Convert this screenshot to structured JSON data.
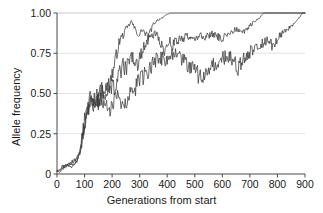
{
  "chart_data": {
    "type": "line",
    "title": "",
    "xlabel": "Generations from start",
    "ylabel": "Allele frequency",
    "xlim": [
      0,
      900
    ],
    "ylim": [
      0,
      1.0
    ],
    "xticks": [
      0,
      100,
      200,
      300,
      400,
      500,
      600,
      700,
      800,
      900
    ],
    "xtick_labels": [
      "0",
      "100",
      "200",
      "300",
      "400",
      "500",
      "600",
      "700",
      "800",
      "900"
    ],
    "yticks": [
      0,
      0.25,
      0.5,
      0.75,
      1.0
    ],
    "ytick_labels": [
      "0",
      "0.25",
      "0.50",
      "0.75",
      "1.00"
    ],
    "grid": "horizontal",
    "grid_color": "#d9d9d9",
    "line_color": "#3a3a3a",
    "legend": "none",
    "series": [
      {
        "name": "replicate-1",
        "comment": "fastest fixation; reaches 1.00 near generation 420 and stays fixed",
        "x": [
          0,
          10,
          20,
          30,
          40,
          50,
          60,
          70,
          80,
          90,
          100,
          110,
          120,
          130,
          140,
          150,
          160,
          170,
          180,
          190,
          200,
          210,
          220,
          230,
          240,
          250,
          260,
          270,
          280,
          290,
          300,
          310,
          320,
          330,
          340,
          350,
          360,
          370,
          380,
          390,
          400,
          410,
          420,
          500,
          600,
          700,
          800,
          900
        ],
        "y": [
          0.02,
          0.03,
          0.05,
          0.04,
          0.06,
          0.07,
          0.06,
          0.09,
          0.12,
          0.2,
          0.3,
          0.4,
          0.45,
          0.44,
          0.47,
          0.46,
          0.5,
          0.54,
          0.52,
          0.57,
          0.62,
          0.68,
          0.78,
          0.84,
          0.86,
          0.9,
          0.92,
          0.95,
          0.91,
          0.88,
          0.86,
          0.9,
          0.87,
          0.85,
          0.89,
          0.93,
          0.95,
          0.96,
          0.97,
          0.98,
          0.99,
          1.0,
          1.0,
          1.0,
          1.0,
          1.0,
          1.0,
          1.0
        ]
      },
      {
        "name": "replicate-2",
        "comment": "intermediate; wanders near 0.80-0.90 then fixes near generation 750",
        "x": [
          0,
          10,
          20,
          30,
          40,
          50,
          60,
          70,
          80,
          90,
          100,
          110,
          120,
          130,
          140,
          150,
          160,
          170,
          180,
          190,
          200,
          210,
          220,
          230,
          240,
          250,
          260,
          270,
          280,
          290,
          300,
          310,
          320,
          330,
          340,
          350,
          360,
          370,
          380,
          390,
          400,
          410,
          420,
          430,
          440,
          450,
          460,
          470,
          480,
          490,
          500,
          520,
          540,
          560,
          580,
          600,
          620,
          640,
          660,
          680,
          700,
          720,
          740,
          750,
          800,
          900
        ],
        "y": [
          0.02,
          0.02,
          0.04,
          0.06,
          0.05,
          0.07,
          0.08,
          0.1,
          0.13,
          0.22,
          0.33,
          0.42,
          0.46,
          0.43,
          0.46,
          0.49,
          0.55,
          0.5,
          0.47,
          0.52,
          0.56,
          0.52,
          0.58,
          0.64,
          0.67,
          0.65,
          0.7,
          0.73,
          0.71,
          0.68,
          0.72,
          0.76,
          0.8,
          0.83,
          0.85,
          0.86,
          0.88,
          0.84,
          0.8,
          0.77,
          0.79,
          0.82,
          0.8,
          0.83,
          0.82,
          0.85,
          0.84,
          0.86,
          0.85,
          0.83,
          0.84,
          0.86,
          0.85,
          0.87,
          0.86,
          0.84,
          0.87,
          0.89,
          0.9,
          0.88,
          0.92,
          0.95,
          0.98,
          1.0,
          1.0,
          1.0
        ]
      },
      {
        "name": "replicate-3",
        "comment": "slowest; dips to 0.55 near generation 520 and 0.65 near 660, fixes near generation 890",
        "x": [
          0,
          10,
          20,
          30,
          40,
          50,
          60,
          70,
          80,
          90,
          100,
          110,
          120,
          130,
          140,
          150,
          160,
          170,
          180,
          190,
          200,
          210,
          220,
          230,
          240,
          250,
          260,
          270,
          280,
          290,
          300,
          310,
          320,
          330,
          340,
          350,
          360,
          370,
          380,
          390,
          400,
          420,
          440,
          460,
          480,
          500,
          520,
          540,
          560,
          580,
          600,
          620,
          640,
          660,
          680,
          700,
          720,
          740,
          760,
          780,
          800,
          820,
          840,
          860,
          880,
          890,
          900
        ],
        "y": [
          0.02,
          0.01,
          0.03,
          0.05,
          0.06,
          0.04,
          0.05,
          0.08,
          0.11,
          0.19,
          0.28,
          0.38,
          0.44,
          0.42,
          0.45,
          0.44,
          0.48,
          0.45,
          0.43,
          0.4,
          0.42,
          0.46,
          0.48,
          0.44,
          0.4,
          0.43,
          0.47,
          0.5,
          0.53,
          0.55,
          0.58,
          0.6,
          0.62,
          0.64,
          0.67,
          0.69,
          0.71,
          0.73,
          0.72,
          0.7,
          0.72,
          0.74,
          0.73,
          0.7,
          0.68,
          0.64,
          0.6,
          0.62,
          0.66,
          0.68,
          0.71,
          0.73,
          0.7,
          0.66,
          0.72,
          0.76,
          0.79,
          0.81,
          0.83,
          0.8,
          0.84,
          0.88,
          0.9,
          0.93,
          0.97,
          1.0,
          1.0
        ]
      }
    ]
  },
  "axes": {
    "ylabel_text": "Allele frequency",
    "xlabel_text": "Generations from start"
  }
}
